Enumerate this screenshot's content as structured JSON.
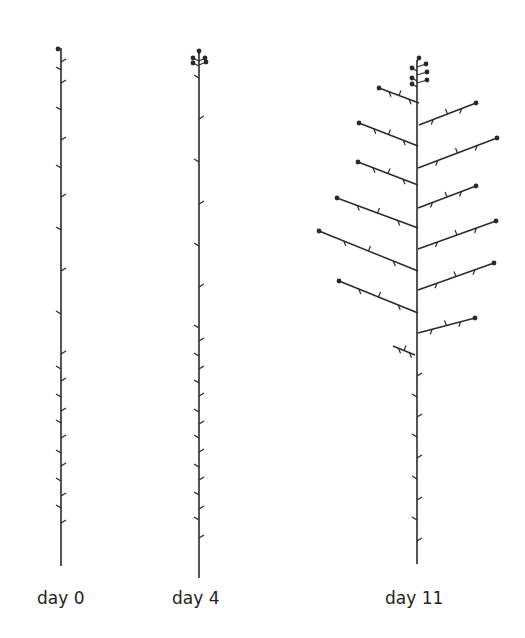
{
  "figure": {
    "ink_color": "#2a2a2a",
    "plants": [
      {
        "id": "day0",
        "label": "day 0",
        "label_x": 37,
        "stem": {
          "x": 61,
          "top": 48,
          "bottom": 566
        },
        "terminal_buds": [
          [
            58,
            49
          ]
        ],
        "leaves": [
          [
            64,
            62,
            1
          ],
          [
            58,
            70,
            -1
          ],
          [
            64,
            83,
            1
          ],
          [
            58,
            110,
            -1
          ],
          [
            64,
            140,
            1
          ],
          [
            58,
            168,
            -1
          ],
          [
            64,
            197,
            1
          ],
          [
            58,
            230,
            -1
          ],
          [
            64,
            271,
            1
          ],
          [
            58,
            314,
            -1
          ],
          [
            64,
            354,
            1
          ],
          [
            58,
            369,
            -1
          ],
          [
            64,
            381,
            1
          ],
          [
            58,
            397,
            -1
          ],
          [
            64,
            411,
            1
          ],
          [
            58,
            423,
            -1
          ],
          [
            64,
            438,
            1
          ],
          [
            58,
            453,
            -1
          ],
          [
            64,
            466,
            1
          ],
          [
            58,
            481,
            -1
          ],
          [
            64,
            496,
            1
          ],
          [
            58,
            508,
            -1
          ],
          [
            64,
            523,
            1
          ]
        ]
      },
      {
        "id": "day4",
        "label": "day 4",
        "label_x": 172,
        "stem": {
          "x": 199,
          "top": 52,
          "bottom": 578
        },
        "terminal_buds": [
          [
            199,
            51
          ],
          [
            193,
            58
          ],
          [
            205,
            58
          ],
          [
            193,
            63
          ],
          [
            206,
            62
          ]
        ],
        "leaves": [
          [
            197,
            78,
            -1
          ],
          [
            201,
            119,
            1
          ],
          [
            197,
            162,
            -1
          ],
          [
            201,
            204,
            1
          ],
          [
            197,
            246,
            -1
          ],
          [
            201,
            287,
            1
          ],
          [
            197,
            328,
            -1
          ],
          [
            201,
            341,
            1
          ],
          [
            197,
            356,
            -1
          ],
          [
            201,
            369,
            1
          ],
          [
            197,
            383,
            -1
          ],
          [
            201,
            396,
            1
          ],
          [
            197,
            412,
            -1
          ],
          [
            201,
            424,
            1
          ],
          [
            197,
            438,
            -1
          ],
          [
            201,
            452,
            1
          ],
          [
            197,
            467,
            -1
          ],
          [
            201,
            480,
            1
          ],
          [
            197,
            495,
            -1
          ],
          [
            201,
            509,
            1
          ],
          [
            197,
            520,
            -1
          ],
          [
            201,
            538,
            1
          ]
        ]
      },
      {
        "id": "day11",
        "label": "day 11",
        "label_x": 385,
        "stem": {
          "x": 417,
          "top": 60,
          "bottom": 564
        },
        "terminal_buds": [
          [
            419,
            58
          ],
          [
            412,
            68
          ],
          [
            426,
            64
          ],
          [
            412,
            78
          ],
          [
            427,
            72
          ],
          [
            412,
            84
          ],
          [
            427,
            80
          ]
        ],
        "branches": [
          {
            "from": [
              419,
              103
            ],
            "to": [
              379,
              88
            ],
            "buds": true
          },
          {
            "from": [
              419,
              125
            ],
            "to": [
              476,
              103
            ],
            "buds": true
          },
          {
            "from": [
              418,
              146
            ],
            "to": [
              359,
              123
            ],
            "buds": true
          },
          {
            "from": [
              418,
              168
            ],
            "to": [
              497,
              138
            ],
            "buds": true
          },
          {
            "from": [
              418,
              185
            ],
            "to": [
              358,
              162
            ],
            "buds": true
          },
          {
            "from": [
              418,
              208
            ],
            "to": [
              476,
              186
            ],
            "buds": true
          },
          {
            "from": [
              418,
              228
            ],
            "to": [
              337,
              198
            ],
            "buds": true
          },
          {
            "from": [
              418,
              249
            ],
            "to": [
              496,
              221
            ],
            "buds": true
          },
          {
            "from": [
              418,
              271
            ],
            "to": [
              319,
              231
            ],
            "buds": true
          },
          {
            "from": [
              418,
              290
            ],
            "to": [
              494,
              263
            ],
            "buds": true
          },
          {
            "from": [
              418,
              313
            ],
            "to": [
              339,
              281
            ],
            "buds": true
          },
          {
            "from": [
              418,
              333
            ],
            "to": [
              475,
              318
            ],
            "buds": true
          },
          {
            "from": [
              415,
              355
            ],
            "to": [
              393,
              346
            ],
            "buds": false
          }
        ],
        "leaves": [
          [
            416,
            376,
            1
          ],
          [
            414,
            397,
            -1
          ],
          [
            416,
            417,
            1
          ],
          [
            414,
            437,
            -1
          ],
          [
            416,
            458,
            1
          ],
          [
            414,
            479,
            -1
          ],
          [
            416,
            500,
            1
          ],
          [
            414,
            520,
            -1
          ],
          [
            416,
            541,
            1
          ]
        ]
      }
    ]
  }
}
